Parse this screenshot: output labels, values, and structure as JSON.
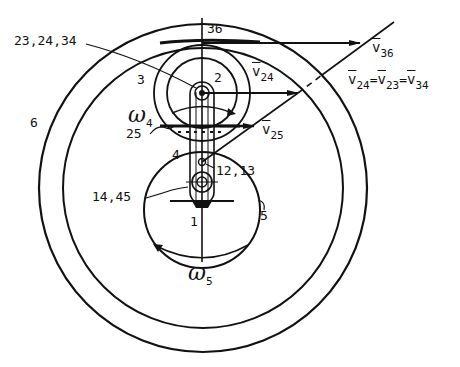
{
  "figure": {
    "type": "planetary-gear-velocity-diagram",
    "ink_color": "#111111",
    "background": "#ffffff"
  },
  "labels": {
    "joint_top": "23,24,34",
    "top_axis": "36",
    "link_3": "3",
    "link_2": "2",
    "link_6": "6",
    "contact_25": "25",
    "link_4": "4",
    "joint_mid": "12,13",
    "joint_bottom": "14,45",
    "link_1": "1",
    "link_5": "5"
  },
  "omega4": {
    "symbol": "ω",
    "sub": "4"
  },
  "omega5": {
    "symbol": "ω",
    "sub": "5"
  },
  "vectors": {
    "v36": {
      "symbol": "v",
      "sub": "36"
    },
    "v24": {
      "symbol": "v",
      "sub": "24"
    },
    "v25": {
      "symbol": "v",
      "sub": "25"
    },
    "equality": {
      "a": {
        "symbol": "v",
        "sub": "24"
      },
      "eq1": "=",
      "b": {
        "symbol": "v",
        "sub": "23"
      },
      "eq2": "=",
      "c": {
        "symbol": "v",
        "sub": "34"
      }
    }
  }
}
